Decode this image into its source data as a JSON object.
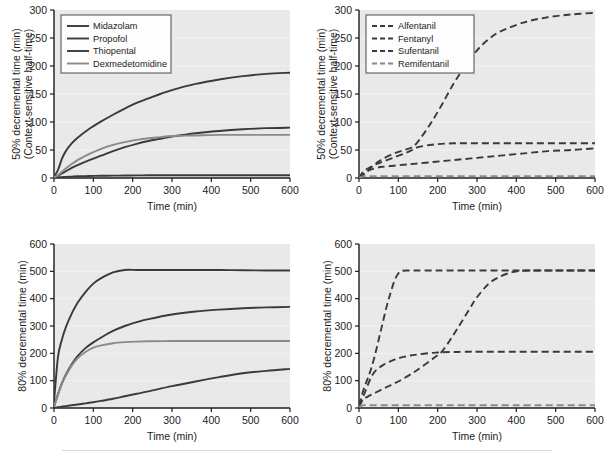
{
  "figure": {
    "panel_count": 4,
    "background_color": "#ffffff",
    "plot_background_color": "#e9e9e9",
    "curve_color": "#3a3a3a",
    "curve_color_light": "#8a8a8a",
    "axis_color": "#1c1c1c"
  },
  "common": {
    "xlabel": "Time (min)",
    "x_ticks": [
      "0",
      "100",
      "200",
      "300",
      "400",
      "500",
      "600"
    ],
    "x_tick_values": [
      0,
      100,
      200,
      300,
      400,
      500,
      600
    ],
    "xlim": [
      0,
      600
    ]
  },
  "panels": [
    {
      "id": "top-left",
      "ylabel_line1": "50% decremental time (min)",
      "ylabel_line2": "(Context-sensitive half-time)",
      "y_ticks": [
        "0",
        "50",
        "100",
        "150",
        "200",
        "250",
        "300"
      ],
      "y_tick_values": [
        0,
        50,
        100,
        150,
        200,
        250,
        300
      ],
      "ylim": [
        0,
        300
      ],
      "line_style": "solid",
      "legend_position": "top-left",
      "legend": [
        "Midazolam",
        "Propofol",
        "Thiopental",
        "Dexmedetomidine"
      ]
    },
    {
      "id": "top-right",
      "ylabel_line1": "50% decremental time (min)",
      "ylabel_line2": "(Context-sensitive half-time)",
      "y_ticks": [
        "0",
        "50",
        "100",
        "150",
        "200",
        "250",
        "300"
      ],
      "y_tick_values": [
        0,
        50,
        100,
        150,
        200,
        250,
        300
      ],
      "ylim": [
        0,
        300
      ],
      "line_style": "dashed",
      "legend_position": "top-left",
      "legend": [
        "Alfentanil",
        "Fentanyl",
        "Sufentanil",
        "Remifentanil"
      ]
    },
    {
      "id": "bottom-left",
      "ylabel_line1": "80% decremental time (min)",
      "ylabel_line2": "",
      "y_ticks": [
        "0",
        "100",
        "200",
        "300",
        "400",
        "500",
        "600"
      ],
      "y_tick_values": [
        0,
        100,
        200,
        300,
        400,
        500,
        600
      ],
      "ylim": [
        0,
        600
      ],
      "line_style": "solid",
      "legend_position": "none",
      "legend": []
    },
    {
      "id": "bottom-right",
      "ylabel_line1": "80% decremental time (min)",
      "ylabel_line2": "",
      "y_ticks": [
        "0",
        "100",
        "200",
        "300",
        "400",
        "500",
        "600"
      ],
      "y_tick_values": [
        0,
        100,
        200,
        300,
        400,
        500,
        600
      ],
      "ylim": [
        0,
        600
      ],
      "line_style": "dashed",
      "legend_position": "none",
      "legend": []
    }
  ],
  "chart_data": [
    {
      "type": "line",
      "panel": "top-left",
      "title": "",
      "xlabel": "Time (min)",
      "ylabel": "50% decremental time (min) (Context-sensitive half-time)",
      "xlim": [
        0,
        600
      ],
      "ylim": [
        0,
        300
      ],
      "grid": false,
      "legend_position": "upper left",
      "x": [
        0,
        10,
        20,
        30,
        45,
        60,
        90,
        120,
        150,
        180,
        210,
        240,
        270,
        300,
        360,
        420,
        480,
        540,
        600
      ],
      "series": [
        {
          "name": "Midazolam",
          "style": "solid",
          "values": [
            2,
            14,
            34,
            48,
            62,
            72,
            88,
            101,
            113,
            124,
            134,
            142,
            150,
            157,
            168,
            176,
            182,
            186,
            188
          ]
        },
        {
          "name": "Propofol",
          "style": "solid",
          "values": [
            1,
            4,
            8,
            12,
            18,
            23,
            32,
            40,
            48,
            55,
            61,
            66,
            70,
            74,
            80,
            84,
            87,
            89,
            90
          ]
        },
        {
          "name": "Thiopental",
          "style": "solid",
          "values": [
            0.5,
            1,
            1.5,
            2,
            2.5,
            3,
            3.5,
            4,
            4.2,
            4.4,
            4.6,
            4.8,
            5,
            5,
            5,
            5,
            5,
            5,
            5
          ]
        },
        {
          "name": "Dexmedetomidine",
          "style": "solid",
          "values": [
            1,
            5,
            11,
            17,
            25,
            32,
            43,
            52,
            59,
            64,
            68,
            71,
            73,
            75,
            76,
            77,
            77,
            77,
            77
          ]
        }
      ]
    },
    {
      "type": "line",
      "panel": "top-right",
      "title": "",
      "xlabel": "Time (min)",
      "ylabel": "50% decremental time (min) (Context-sensitive half-time)",
      "xlim": [
        0,
        600
      ],
      "ylim": [
        0,
        300
      ],
      "grid": false,
      "legend_position": "upper left",
      "x": [
        0,
        10,
        20,
        30,
        45,
        60,
        90,
        120,
        135,
        150,
        180,
        210,
        240,
        270,
        300,
        330,
        360,
        420,
        480,
        540,
        600
      ],
      "series": [
        {
          "name": "Alfentanil",
          "style": "dashed",
          "values": [
            0,
            11,
            16,
            20,
            25,
            29,
            37,
            45,
            50,
            55,
            59,
            61,
            62,
            62,
            62,
            62,
            62,
            62,
            62,
            62,
            62
          ]
        },
        {
          "name": "Fentanyl",
          "style": "dashed",
          "values": [
            0,
            5,
            11,
            18,
            27,
            34,
            44,
            51,
            55,
            65,
            95,
            130,
            168,
            200,
            228,
            248,
            262,
            278,
            287,
            292,
            295
          ]
        },
        {
          "name": "Sufentanil",
          "style": "dashed",
          "values": [
            0,
            7,
            12,
            15,
            18,
            20,
            22,
            24,
            25,
            26,
            28,
            30,
            32,
            34,
            36,
            38,
            40,
            44,
            48,
            50,
            53
          ]
        },
        {
          "name": "Remifentanil",
          "style": "dashed",
          "values": [
            0,
            3,
            3,
            3,
            3,
            3,
            3,
            3,
            3,
            3,
            3,
            3,
            3,
            3,
            3,
            3,
            3,
            3,
            3,
            3,
            3
          ]
        }
      ]
    },
    {
      "type": "line",
      "panel": "bottom-left",
      "title": "",
      "xlabel": "Time (min)",
      "ylabel": "80% decremental time (min)",
      "xlim": [
        0,
        600
      ],
      "ylim": [
        0,
        600
      ],
      "grid": false,
      "legend_position": "none",
      "x": [
        0,
        10,
        20,
        30,
        45,
        60,
        80,
        100,
        120,
        150,
        180,
        210,
        240,
        300,
        360,
        420,
        480,
        540,
        600
      ],
      "series": [
        {
          "name": "Midazolam",
          "style": "solid",
          "values": [
            20,
            185,
            250,
            295,
            345,
            385,
            424,
            455,
            475,
            496,
            505,
            505,
            505,
            505,
            505,
            505,
            504,
            503,
            503
          ]
        },
        {
          "name": "Propofol",
          "style": "solid",
          "values": [
            5,
            50,
            90,
            122,
            160,
            190,
            219,
            240,
            258,
            282,
            300,
            314,
            325,
            342,
            353,
            360,
            365,
            368,
            370
          ]
        },
        {
          "name": "Dexmedetomidine",
          "style": "solid",
          "values": [
            5,
            48,
            88,
            118,
            155,
            182,
            205,
            221,
            229,
            237,
            241,
            243,
            244,
            245,
            245,
            245,
            245,
            245,
            245
          ]
        },
        {
          "name": "Thiopental",
          "style": "solid",
          "values": [
            0,
            3,
            5,
            7,
            10,
            13,
            17,
            21,
            26,
            34,
            43,
            52,
            61,
            80,
            97,
            113,
            127,
            136,
            143
          ]
        }
      ]
    },
    {
      "type": "line",
      "panel": "bottom-right",
      "title": "",
      "xlabel": "Time (min)",
      "ylabel": "80% decremental time (min)",
      "xlim": [
        0,
        600
      ],
      "ylim": [
        0,
        600
      ],
      "grid": false,
      "legend_position": "none",
      "x": [
        0,
        10,
        20,
        30,
        40,
        50,
        60,
        70,
        80,
        90,
        100,
        110,
        130,
        150,
        180,
        200,
        210,
        230,
        250,
        280,
        300,
        330,
        360,
        390,
        410,
        450,
        500,
        550,
        600
      ],
      "series": [
        {
          "name": "Fentanyl",
          "style": "dashed",
          "values": [
            10,
            60,
            100,
            140,
            190,
            250,
            310,
            370,
            420,
            465,
            492,
            502,
            503,
            503,
            503,
            503,
            503,
            503,
            503,
            503,
            503,
            503,
            503,
            503,
            503,
            503,
            503,
            503,
            503
          ]
        },
        {
          "name": "Alfentanil",
          "style": "dashed",
          "values": [
            8,
            40,
            75,
            110,
            133,
            146,
            156,
            164,
            171,
            177,
            182,
            186,
            192,
            196,
            201,
            203,
            204,
            205,
            205,
            206,
            206,
            206,
            206,
            206,
            206,
            206,
            206,
            206,
            206
          ]
        },
        {
          "name": "Sufentanil",
          "style": "dashed",
          "values": [
            5,
            30,
            40,
            48,
            55,
            62,
            69,
            76,
            83,
            90,
            97,
            105,
            122,
            141,
            172,
            193,
            205,
            245,
            290,
            360,
            405,
            455,
            482,
            497,
            502,
            503,
            503,
            503,
            503
          ]
        },
        {
          "name": "Remifentanil",
          "style": "dashed",
          "values": [
            4,
            10,
            10,
            10,
            10,
            10,
            10,
            10,
            10,
            10,
            10,
            10,
            10,
            10,
            10,
            10,
            10,
            10,
            10,
            10,
            10,
            10,
            10,
            10,
            10,
            10,
            10,
            10,
            10
          ]
        }
      ]
    }
  ]
}
